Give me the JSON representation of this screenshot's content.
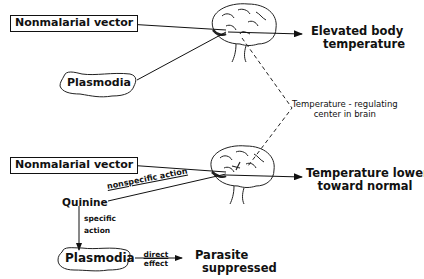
{
  "diagram": {
    "top_panel": {
      "vector_label": "Nonmalarial vector",
      "plasmodia_label": "Plasmodia",
      "outcome_line1": "Elevated body",
      "outcome_line2": "temperature"
    },
    "center_annotation": {
      "line1": "Temperature - regulating",
      "line2": "center in brain"
    },
    "bottom_panel": {
      "vector_label": "Nonmalarial vector",
      "quinine_label": "Quinine",
      "nonspecific_action_label": "nonspecific action",
      "specific_action_line1": "specific",
      "specific_action_line2": "action",
      "plasmodia_label": "Plasmodia",
      "direct_effect_line1": "direct",
      "direct_effect_line2": "effect",
      "outcome_line1": "Temperature lowered",
      "outcome_line2": "toward normal",
      "parasite_line1": "Parasite",
      "parasite_line2": "suppressed"
    }
  }
}
